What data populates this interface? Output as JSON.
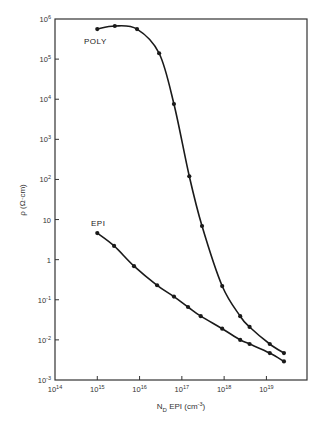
{
  "chart_data": {
    "type": "line",
    "title": "",
    "xlabel": "N_D EPI (cm^-3)",
    "ylabel": "ρ (Ω·cm)",
    "xscale": "log",
    "yscale": "log",
    "xlim": [
      100000000000000.0,
      1e+20
    ],
    "ylim": [
      0.001,
      1000000.0
    ],
    "grid": false,
    "legend": "inline labels",
    "x_ticks": [
      "10^14",
      "10^15",
      "10^16",
      "10^17",
      "10^18",
      "10^19"
    ],
    "y_ticks": [
      "10^-3",
      "10^-2",
      "10^-1",
      "1",
      "10",
      "10^2",
      "10^3",
      "10^4",
      "10^5",
      "10^6"
    ],
    "series": [
      {
        "name": "POLY",
        "x": [
          1000000000000000.0,
          2600000000000000.0,
          8700000000000000.0,
          2.9e+16,
          6.5e+16,
          1.5e+17,
          3e+17,
          9e+17,
          2.4e+18,
          4e+18,
          1.2e+19,
          2.6e+19
        ],
        "values": [
          560000.0,
          670000.0,
          560000.0,
          140000.0,
          7600.0,
          120,
          6.9,
          0.22,
          0.039,
          0.021,
          0.0079,
          0.0047
        ]
      },
      {
        "name": "EPI",
        "x": [
          1000000000000000.0,
          2500000000000000.0,
          7400000000000000.0,
          2.6e+16,
          6.5e+16,
          1.4e+17,
          2.8e+17,
          9e+17,
          2.4e+18,
          4e+18,
          1.2e+19,
          2.6e+19
        ],
        "values": [
          4.6,
          2.2,
          0.69,
          0.23,
          0.12,
          0.066,
          0.039,
          0.019,
          0.01,
          0.0079,
          0.0047,
          0.0029
        ]
      }
    ]
  },
  "labels": {
    "x_axis": {
      "main": "N",
      "sub": "D",
      "rest": " EPI  (cm",
      "sup": "-3",
      "end": ")"
    },
    "y_axis": "ρ  (Ω·cm)",
    "x_ticks": [
      {
        "base": "10",
        "exp": "14"
      },
      {
        "base": "10",
        "exp": "15"
      },
      {
        "base": "10",
        "exp": "16"
      },
      {
        "base": "10",
        "exp": "17"
      },
      {
        "base": "10",
        "exp": "18"
      },
      {
        "base": "10",
        "exp": "19"
      }
    ],
    "y_ticks": [
      {
        "base": "10",
        "exp": "6"
      },
      {
        "base": "10",
        "exp": "5"
      },
      {
        "base": "10",
        "exp": "4"
      },
      {
        "base": "10",
        "exp": "3"
      },
      {
        "base": "10",
        "exp": "2"
      },
      {
        "base": "10",
        "exp": ""
      },
      {
        "base": "1",
        "exp": ""
      },
      {
        "base": "10",
        "exp": "-1"
      },
      {
        "base": "10",
        "exp": "-2"
      },
      {
        "base": "10",
        "exp": "-3"
      }
    ],
    "series_poly": "POLY",
    "series_epi": "EPI"
  },
  "style": {
    "line_color": "#1a1a1a",
    "axis_color": "#333333"
  }
}
